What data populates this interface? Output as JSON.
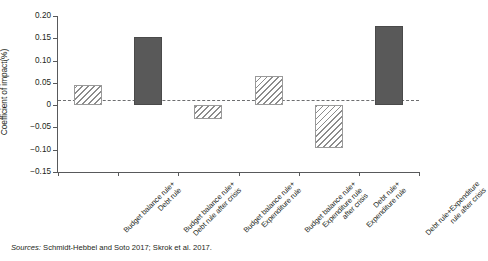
{
  "chart_data": {
    "type": "bar",
    "title": "",
    "xlabel": "",
    "ylabel": "Coefficient of impact(%)",
    "ylim": [
      -0.15,
      0.2
    ],
    "yticks": [
      0.2,
      0.15,
      0.1,
      0.05,
      0,
      -0.05,
      -0.1,
      -0.15
    ],
    "ytick_labels": [
      "0.20",
      "0.15",
      "0.10",
      "0.05",
      "0",
      "−0.05",
      "−0.10",
      "−0.15"
    ],
    "grid": false,
    "legend": "none",
    "zero_line": true,
    "categories": [
      "Budget balance rule+\nDebt rule",
      "Budget balance rule+\nDebt rule after crisis",
      "Budget balance rule+\nExpenditure rule",
      "Budget balance rule+\nExpenditure rule\nafter crisis",
      "Debt rule+\nExpenditure rule",
      "Debt rule+Expenditure\nrule after crisis"
    ],
    "category_lines": [
      [
        "Budget balance  rule+",
        "Debt rule"
      ],
      [
        "Budget balance  rule+",
        "Debt rule after crisis"
      ],
      [
        "Budget balance  rule+",
        "Expenditure rule"
      ],
      [
        "Budget balance  rule+",
        "Expenditure rule",
        "after crisis"
      ],
      [
        "Debt rule+",
        "Expenditure rule"
      ],
      [
        "Debt rule+Expenditure",
        "rule after crisis"
      ]
    ],
    "values": [
      0.046,
      0.152,
      -0.031,
      0.065,
      -0.096,
      0.177
    ],
    "bar_styles": [
      "hatched",
      "solid",
      "hatched",
      "hatched",
      "hatched",
      "solid"
    ],
    "colors": {
      "solid_fill": "#595959",
      "hatch_stroke": "#8c8c8c",
      "hatch_fill": "#ffffff",
      "axis": "#58595b",
      "text": "#231f20"
    }
  },
  "source": {
    "prefix": "Sources:",
    "text": " Schmidt-Hebbel and Soto 2017; Skrok et al. 2017."
  }
}
